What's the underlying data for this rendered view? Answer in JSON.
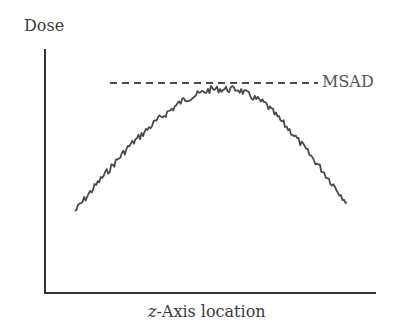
{
  "chart_data": {
    "type": "line",
    "title": "",
    "xlabel_italic_prefix": "z",
    "xlabel_rest": "-Axis location",
    "xlabel": "z-Axis location",
    "ylabel": "Dose",
    "grid": false,
    "ticks": "none",
    "series": [
      {
        "name": "Dose profile",
        "style": "noisy solid line",
        "color": "#4a4a4a",
        "x": [
          0.0,
          0.1,
          0.2,
          0.3,
          0.4,
          0.5,
          0.6,
          0.7,
          0.8,
          0.9,
          1.0
        ],
        "values": [
          0.39,
          0.55,
          0.7,
          0.82,
          0.92,
          0.97,
          0.97,
          0.9,
          0.76,
          0.6,
          0.43
        ]
      }
    ],
    "annotations": [
      {
        "label": "MSAD",
        "type": "horizontal dashed reference line",
        "value": 1.0,
        "color": "#4a4a4a"
      }
    ],
    "legend": "none (inline label MSAD at right end of dashed line)"
  },
  "labels": {
    "y_axis": "Dose",
    "x_axis_var": "z",
    "x_axis_rest": "-Axis location",
    "msad": "MSAD"
  }
}
